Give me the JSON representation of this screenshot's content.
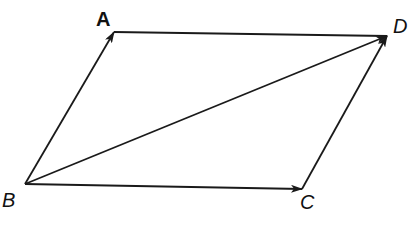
{
  "diagram": {
    "type": "vector-parallelogram",
    "points": {
      "A": {
        "label": "A",
        "x": 114,
        "y": 32
      },
      "B": {
        "label": "B",
        "x": 25,
        "y": 184
      },
      "C": {
        "label": "C",
        "x": 302,
        "y": 189
      },
      "D": {
        "label": "D",
        "x": 387,
        "y": 36
      }
    },
    "edges": [
      {
        "from": "B",
        "to": "A",
        "arrow": true
      },
      {
        "from": "A",
        "to": "D",
        "arrow": false
      },
      {
        "from": "B",
        "to": "D",
        "arrow": true
      },
      {
        "from": "B",
        "to": "C",
        "arrow": true
      },
      {
        "from": "C",
        "to": "D",
        "arrow": true
      }
    ],
    "colors": {
      "stroke": "#1a1a1a",
      "background": "#ffffff"
    }
  }
}
